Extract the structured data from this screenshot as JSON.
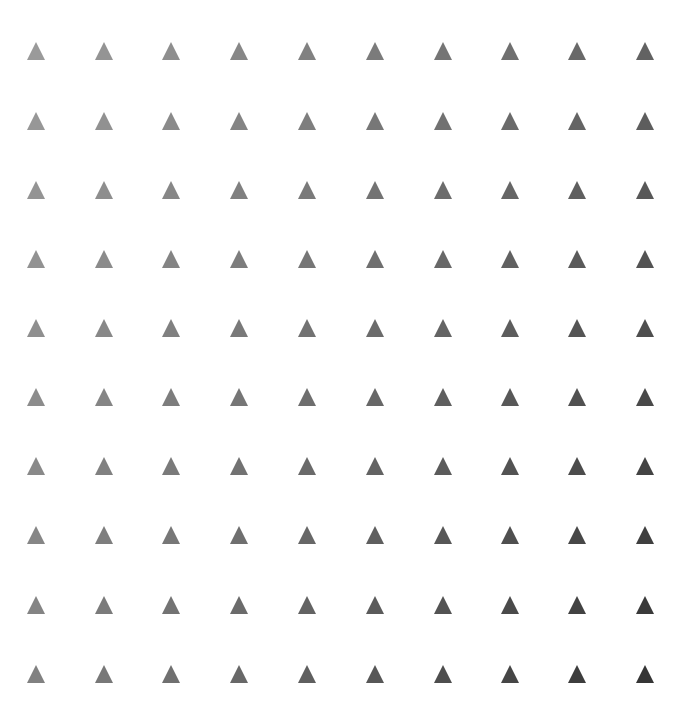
{
  "grid": {
    "shape": "triangle",
    "rows": 10,
    "cols": 10,
    "col_centers_x": [
      36,
      104,
      171,
      239,
      307,
      375,
      443,
      510,
      577,
      645
    ],
    "row_centers_y": [
      51,
      121,
      190,
      259,
      328,
      397,
      466,
      535,
      605,
      674
    ],
    "color_top_left": "#9a9a9a",
    "color_bottom_right": "#353535",
    "background": "#ffffff"
  }
}
